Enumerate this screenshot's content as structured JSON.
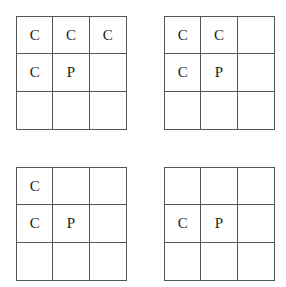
{
  "grids": [
    {
      "cells": [
        "C",
        "C",
        "C",
        "C",
        "P",
        "",
        "",
        "",
        ""
      ]
    },
    {
      "cells": [
        "C",
        "C",
        "",
        "C",
        "P",
        "",
        "",
        "",
        ""
      ]
    },
    {
      "cells": [
        "C",
        "",
        "",
        "C",
        "P",
        "",
        "",
        "",
        ""
      ]
    },
    {
      "cells": [
        "",
        "",
        "",
        "C",
        "P",
        "",
        "",
        "",
        ""
      ]
    }
  ]
}
